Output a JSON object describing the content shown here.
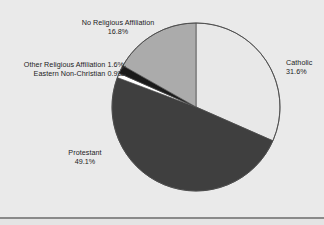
{
  "figure": {
    "background_color": "#eaeaea",
    "width": 324,
    "height": 225,
    "bottom_rule_color": "#8a8a8a"
  },
  "pie": {
    "center_x": 196,
    "center_y": 107,
    "radius": 84,
    "outline_color": "#4a4a4a",
    "start_angle_deg": 0,
    "direction": "clockwise"
  },
  "labels": {
    "none": {
      "line1": "No Religious Affiliation",
      "line2": "16.8%"
    },
    "other": {
      "line1": "Other Religious Affiliation 1.6%",
      "line2": "Eastern Non-Christian 0.9%"
    },
    "catholic": {
      "line1": "Catholic",
      "line2": "31.6%"
    },
    "protestant": {
      "line1": "Protestant",
      "line2": "49.1%"
    }
  },
  "chart_data": {
    "type": "pie",
    "title": "",
    "subtitle": "",
    "xlabel": "",
    "ylabel": "",
    "legend_position": "none",
    "grid": false,
    "labels_outside": true,
    "start_angle_deg": 90,
    "counterclock": false,
    "unit": "percent",
    "total": 100.0,
    "categories": [
      "Catholic",
      "Protestant",
      "Eastern Non-Christian",
      "Other Religious Affiliation",
      "No Religious Affiliation"
    ],
    "values": [
      31.6,
      49.1,
      0.9,
      1.6,
      16.8
    ],
    "colors": [
      "#e8e8e8",
      "#3f3f3f",
      "#ffffff",
      "#1a1a1a",
      "#ababab"
    ],
    "slices": [
      {
        "name": "Catholic",
        "value": 31.6,
        "value_label": "31.6%",
        "color": "#e8e8e8",
        "start_deg": 0.0,
        "end_deg": 113.76,
        "label_position": "right"
      },
      {
        "name": "Protestant",
        "value": 49.1,
        "value_label": "49.1%",
        "color": "#3f3f3f",
        "start_deg": 113.76,
        "end_deg": 290.52,
        "label_position": "bottom-left"
      },
      {
        "name": "Eastern Non-Christian",
        "value": 0.9,
        "value_label": "0.9%",
        "color": "#ffffff",
        "start_deg": 290.52,
        "end_deg": 293.76,
        "label_position": "left"
      },
      {
        "name": "Other Religious Affiliation",
        "value": 1.6,
        "value_label": "1.6%",
        "color": "#1a1a1a",
        "start_deg": 293.76,
        "end_deg": 299.52,
        "label_position": "left"
      },
      {
        "name": "No Religious Affiliation",
        "value": 16.8,
        "value_label": "16.8%",
        "color": "#ababab",
        "start_deg": 299.52,
        "end_deg": 360.0,
        "label_position": "top"
      }
    ]
  }
}
